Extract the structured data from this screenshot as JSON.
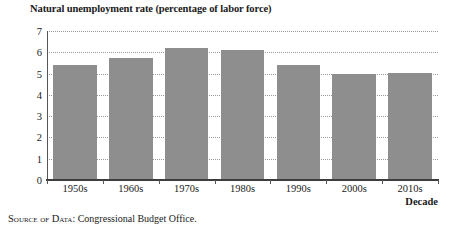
{
  "chart_data": {
    "type": "bar",
    "title": "Natural unemployment rate (percentage of labor force)",
    "xlabel": "Decade",
    "ylabel": "",
    "categories": [
      "1950s",
      "1960s",
      "1970s",
      "1980s",
      "1990s",
      "2000s",
      "2010s"
    ],
    "values": [
      5.4,
      5.75,
      6.2,
      6.1,
      5.4,
      5.0,
      5.05
    ],
    "ylim": [
      0,
      7
    ],
    "yticks": [
      0,
      1,
      2,
      3,
      4,
      5,
      6,
      7
    ],
    "ytick_labels": [
      "0",
      "1",
      "2",
      "3",
      "4",
      "5",
      "6",
      "7"
    ],
    "grid": true,
    "grid_style": "dotted",
    "legend": null,
    "bar_color": "#8e8e8e",
    "background": "#ffffff"
  },
  "source_note": {
    "prefix": "Source of Data",
    "separator": ":",
    "text": "Congressional Budget Office."
  }
}
